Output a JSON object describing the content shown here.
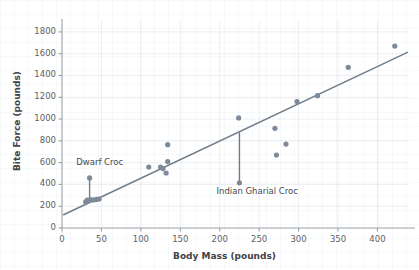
{
  "chart_data": {
    "type": "scatter",
    "title": "",
    "xlabel": "Body Mass (pounds)",
    "ylabel": "Bite Force (pounds)",
    "xlim": [
      0,
      440
    ],
    "ylim": [
      0,
      1900
    ],
    "xticks": [
      0,
      50,
      100,
      150,
      200,
      250,
      300,
      350,
      400
    ],
    "yticks": [
      0,
      200,
      400,
      600,
      800,
      1000,
      1200,
      1400,
      1600,
      1800
    ],
    "grid": true,
    "legend": "none",
    "point_color": "#7d8b99",
    "line_color": "#6f7d8b",
    "points": [
      {
        "x": 30,
        "y": 240
      },
      {
        "x": 32,
        "y": 255
      },
      {
        "x": 34,
        "y": 250
      },
      {
        "x": 36,
        "y": 260
      },
      {
        "x": 40,
        "y": 258
      },
      {
        "x": 44,
        "y": 262
      },
      {
        "x": 47,
        "y": 266
      },
      {
        "x": 35,
        "y": 460,
        "label": "Dwarf Croc"
      },
      {
        "x": 110,
        "y": 560
      },
      {
        "x": 125,
        "y": 560
      },
      {
        "x": 128,
        "y": 545
      },
      {
        "x": 132,
        "y": 505
      },
      {
        "x": 134,
        "y": 610
      },
      {
        "x": 134,
        "y": 765
      },
      {
        "x": 224,
        "y": 1010
      },
      {
        "x": 225,
        "y": 415,
        "label": "Indian Gharial Croc"
      },
      {
        "x": 270,
        "y": 915
      },
      {
        "x": 272,
        "y": 670
      },
      {
        "x": 284,
        "y": 770
      },
      {
        "x": 298,
        "y": 1160
      },
      {
        "x": 324,
        "y": 1215
      },
      {
        "x": 363,
        "y": 1475
      },
      {
        "x": 422,
        "y": 1670
      }
    ],
    "fit_line": {
      "x_start": 2,
      "y_start": 122,
      "x_end": 438,
      "y_end": 1612
    },
    "residual_lines": [
      {
        "x": 35,
        "y_top": 460,
        "y_bottom": 250
      },
      {
        "x": 225,
        "y_top": 878,
        "y_bottom": 415
      }
    ],
    "annotations": [
      {
        "text": "Dwarf Croc",
        "x": 18,
        "y": 600
      },
      {
        "text": "Indian Gharial Croc",
        "x": 196,
        "y": 332
      }
    ]
  }
}
